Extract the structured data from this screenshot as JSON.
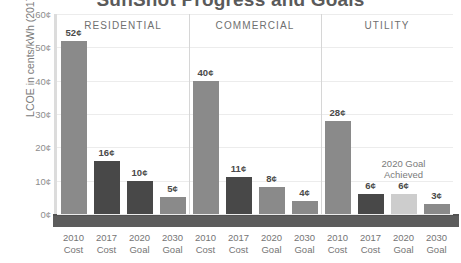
{
  "chart_data": {
    "type": "bar",
    "title": "SunShot Progress and Goals",
    "xlabel": "",
    "ylabel": "LCOE in cents/kWh (2017 $)*",
    "ylim": [
      0,
      60
    ],
    "ytick_labels": [
      "0¢",
      "10¢",
      "20¢",
      "30¢",
      "40¢",
      "50¢",
      "60¢"
    ],
    "ytick_values": [
      0,
      10,
      20,
      30,
      40,
      50,
      60
    ],
    "grid": true,
    "legend": "none",
    "categories": [
      "2010 Cost",
      "2017 Cost",
      "2020 Goal",
      "2030 Goal"
    ],
    "category_lines": [
      {
        "l1": "2010",
        "l2": "Cost"
      },
      {
        "l1": "2017",
        "l2": "Cost"
      },
      {
        "l1": "2020",
        "l2": "Goal"
      },
      {
        "l1": "2030",
        "l2": "Goal"
      }
    ],
    "panels": [
      {
        "name": "RESIDENTIAL",
        "values": [
          52,
          16,
          10,
          5
        ],
        "labels": [
          "52¢",
          "16¢",
          "10¢",
          "5¢"
        ],
        "shades": [
          "mid",
          "dark",
          "dark",
          "mid"
        ]
      },
      {
        "name": "COMMERCIAL",
        "values": [
          40,
          11,
          8,
          4
        ],
        "labels": [
          "40¢",
          "11¢",
          "8¢",
          "4¢"
        ],
        "shades": [
          "mid",
          "dark",
          "mid",
          "mid"
        ]
      },
      {
        "name": "UTILITY",
        "values": [
          28,
          6,
          6,
          3
        ],
        "labels": [
          "28¢",
          "6¢",
          "6¢",
          "3¢"
        ],
        "shades": [
          "mid",
          "dark",
          "light",
          "mid"
        ]
      }
    ],
    "annotations": [
      {
        "text_line1": "2020 Goal",
        "text_line2": "Achieved",
        "panel": "UTILITY",
        "category": "2020 Goal"
      }
    ],
    "colors": {
      "bar_2010_cost": "#8a8a8a",
      "bar_2017_cost": "#484848",
      "bar_goal_light": "#cdcdcd",
      "baseline": "#4f4f4f",
      "gridline": "#ececec",
      "text": "#6f6f6f"
    }
  }
}
